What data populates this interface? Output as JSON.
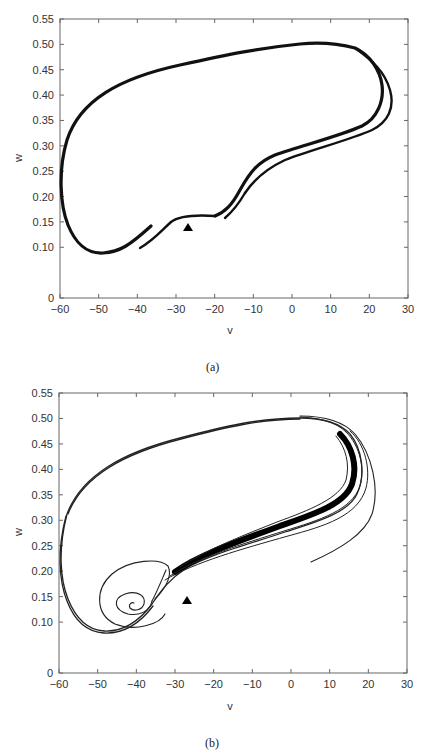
{
  "chart_data": [
    {
      "type": "line",
      "panel": "(a)",
      "title": "",
      "xlabel": "v",
      "ylabel": "w",
      "xlim": [
        -60,
        30
      ],
      "ylim": [
        0,
        0.55
      ],
      "x_ticks": [
        "-60",
        "-50",
        "-40",
        "-30",
        "-20",
        "-10",
        "0",
        "10",
        "20",
        "30"
      ],
      "y_ticks": [
        "0",
        "0.10",
        "0.15",
        "0.20",
        "0.25",
        "0.30",
        "0.35",
        "0.40",
        "0.45",
        "0.50",
        "0.55"
      ],
      "grid": false,
      "legend": null,
      "series": [
        {
          "name": "trajectory (thick double limit-cycle loop)",
          "points": [
            [
              -11,
              0.21
            ],
            [
              -15,
              0.16
            ],
            [
              -20,
              0.12
            ],
            [
              -26,
              0.1
            ],
            [
              -31,
              0.1
            ],
            [
              -38,
              0.13
            ],
            [
              -45,
              0.18
            ],
            [
              -49,
              0.24
            ],
            [
              -50,
              0.29
            ],
            [
              -49,
              0.34
            ],
            [
              -45,
              0.39
            ],
            [
              -38,
              0.43
            ],
            [
              -25,
              0.47
            ],
            [
              -10,
              0.495
            ],
            [
              2,
              0.505
            ],
            [
              10,
              0.5
            ],
            [
              17,
              0.47
            ],
            [
              21,
              0.42
            ],
            [
              22,
              0.38
            ],
            [
              20,
              0.34
            ],
            [
              14,
              0.31
            ],
            [
              5,
              0.285
            ],
            [
              -3,
              0.26
            ],
            [
              -8,
              0.23
            ],
            [
              -11,
              0.21
            ]
          ]
        }
      ],
      "markers": [
        {
          "shape": "triangle",
          "v": -26,
          "w": 0.13
        }
      ]
    },
    {
      "type": "line",
      "panel": "(b)",
      "title": "",
      "xlabel": "v",
      "ylabel": "w",
      "xlim": [
        -60,
        30
      ],
      "ylim": [
        0,
        0.55
      ],
      "x_ticks": [
        "-60",
        "-50",
        "-40",
        "-30",
        "-20",
        "-10",
        "0",
        "10",
        "20",
        "30"
      ],
      "y_ticks": [
        "0",
        "0.10",
        "0.15",
        "0.20",
        "0.25",
        "0.30",
        "0.35",
        "0.40",
        "0.45",
        "0.50",
        "0.55"
      ],
      "grid": false,
      "legend": null,
      "series": [
        {
          "name": "trajectory (transient spiral converging to attractor band)",
          "points": [
            [
              5,
              0.2
            ],
            [
              15,
              0.24
            ],
            [
              25,
              0.3
            ],
            [
              28,
              0.35
            ],
            [
              26,
              0.4
            ],
            [
              20,
              0.46
            ],
            [
              12,
              0.495
            ],
            [
              2,
              0.508
            ],
            [
              -10,
              0.5
            ],
            [
              -25,
              0.47
            ],
            [
              -38,
              0.43
            ],
            [
              -45,
              0.39
            ],
            [
              -49,
              0.34
            ],
            [
              -50,
              0.29
            ],
            [
              -49,
              0.24
            ],
            [
              -45,
              0.18
            ],
            [
              -38,
              0.13
            ],
            [
              -31,
              0.1
            ],
            [
              -26,
              0.1
            ],
            [
              -20,
              0.12
            ],
            [
              -15,
              0.17
            ],
            [
              -12,
              0.22
            ],
            [
              -8,
              0.25
            ],
            [
              0,
              0.28
            ],
            [
              10,
              0.31
            ],
            [
              18,
              0.34
            ],
            [
              21,
              0.4
            ],
            [
              18,
              0.46
            ],
            [
              10,
              0.5
            ]
          ]
        },
        {
          "name": "inner spiral toward fixed point",
          "points": [
            [
              -13,
              0.22
            ],
            [
              -18,
              0.26
            ],
            [
              -28,
              0.25
            ],
            [
              -35,
              0.2
            ],
            [
              -37,
              0.16
            ],
            [
              -33,
              0.12
            ],
            [
              -26,
              0.11
            ],
            [
              -22,
              0.13
            ],
            [
              -24,
              0.15
            ],
            [
              -28,
              0.15
            ],
            [
              -30,
              0.13
            ],
            [
              -27,
              0.12
            ],
            [
              -25,
              0.13
            ],
            [
              -26,
              0.135
            ]
          ]
        }
      ],
      "markers": [
        {
          "shape": "triangle",
          "v": -26,
          "w": 0.13
        }
      ]
    }
  ],
  "captions": {
    "a": "(a)",
    "b": "(b)"
  },
  "axes": {
    "xlabel": "v",
    "ylabel": "w",
    "x_ticks": [
      "−60",
      "−50",
      "−40",
      "−30",
      "−20",
      "−10",
      "0",
      "10",
      "20",
      "30"
    ],
    "y_ticks": [
      "0",
      "0.10",
      "0.15",
      "0.20",
      "0.25",
      "0.30",
      "0.35",
      "0.40",
      "0.45",
      "0.50",
      "0.55"
    ]
  }
}
